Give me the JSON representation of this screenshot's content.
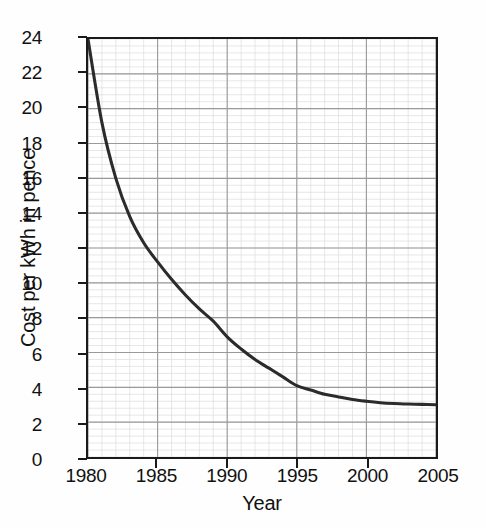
{
  "chart_data": {
    "type": "line",
    "title": "",
    "xlabel": "Year",
    "ylabel": "Cost per kWh in pence",
    "xlim": [
      1980,
      2005
    ],
    "ylim": [
      0,
      24
    ],
    "grid": true,
    "minor_grid": true,
    "legend": "none",
    "x_ticks": [
      "1980",
      "1985",
      "1990",
      "1995",
      "2000",
      "2005"
    ],
    "x_tick_values": [
      1980,
      1985,
      1990,
      1995,
      2000,
      2005
    ],
    "y_ticks": [
      "0",
      "2",
      "4",
      "6",
      "8",
      "10",
      "12",
      "14",
      "16",
      "18",
      "20",
      "22",
      "24"
    ],
    "y_tick_values": [
      0,
      2,
      4,
      6,
      8,
      10,
      12,
      14,
      16,
      18,
      20,
      22,
      24
    ],
    "series": [
      {
        "name": "Cost per kWh",
        "color": "#2b2b2b",
        "x": [
          1980,
          1981,
          1982,
          1983,
          1984,
          1985,
          1986,
          1987,
          1988,
          1989,
          1990,
          1991,
          1992,
          1993,
          1994,
          1995,
          1996,
          1997,
          1998,
          1999,
          2000,
          2001,
          2002,
          2003,
          2004,
          2005
        ],
        "values": [
          24.0,
          19.2,
          16.0,
          13.8,
          12.3,
          11.2,
          10.2,
          9.3,
          8.5,
          7.8,
          6.9,
          6.2,
          5.6,
          5.1,
          4.6,
          4.1,
          3.85,
          3.6,
          3.45,
          3.3,
          3.2,
          3.12,
          3.07,
          3.04,
          3.02,
          3.0
        ]
      }
    ]
  },
  "axes": {
    "x_title": "Year",
    "y_title": "Cost per kWh in pence"
  },
  "colors": {
    "curve": "#2b2b2b",
    "axis": "#1a1a1a",
    "grid_major": "#9a9a9a",
    "grid_minor": "#dcdcdc",
    "background": "#ffffff",
    "text": "#111111"
  }
}
